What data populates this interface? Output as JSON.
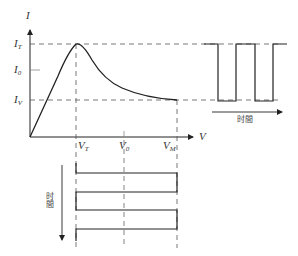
{
  "diagram": {
    "type": "tunnel-diode-iv-characteristic-with-oscillation",
    "axes": {
      "y_label": "I",
      "x_label": "V"
    },
    "current_levels": [
      {
        "name": "I_T",
        "main": "I",
        "sub": "T"
      },
      {
        "name": "I_0",
        "main": "I",
        "sub": "0"
      },
      {
        "name": "I_V",
        "main": "I",
        "sub": "V"
      }
    ],
    "voltage_levels": [
      {
        "name": "V_T",
        "main": "V",
        "sub": "T"
      },
      {
        "name": "V_0",
        "main": "V",
        "sub": "0"
      },
      {
        "name": "V_M",
        "main": "V",
        "sub": "M"
      }
    ],
    "current_waveform": {
      "time_label": "时間"
    },
    "voltage_waveform": {
      "time_label": "时間"
    },
    "colors": {
      "line": "#222222",
      "dash": "#555555",
      "background": "#ffffff"
    }
  }
}
